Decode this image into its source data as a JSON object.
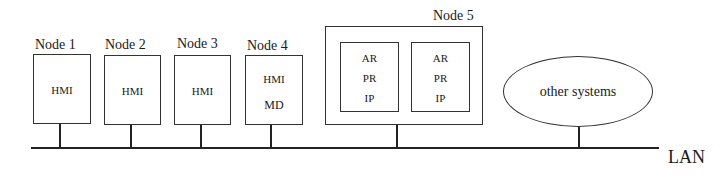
{
  "diagram": {
    "nodes": [
      {
        "label": "Node 1",
        "contents": [
          "HMI"
        ]
      },
      {
        "label": "Node 2",
        "contents": [
          "HMI"
        ]
      },
      {
        "label": "Node 3",
        "contents": [
          "HMI"
        ]
      },
      {
        "label": "Node 4",
        "contents": [
          "HMI",
          "MD"
        ]
      },
      {
        "label": "Node 5",
        "subsystems": [
          {
            "contents": [
              "AR",
              "PR",
              "IP"
            ]
          },
          {
            "contents": [
              "AR",
              "PR",
              "IP"
            ]
          }
        ]
      }
    ],
    "other": {
      "label": "other systems"
    },
    "network": {
      "label": "LAN"
    }
  }
}
